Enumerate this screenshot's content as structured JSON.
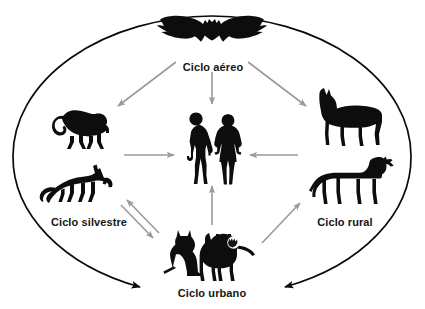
{
  "diagram": {
    "background_color": "#ffffff",
    "ellipse_color": "#000000",
    "arrow_color": "#9a9a9a",
    "silhouette_color": "#0d0d0d",
    "labels": [
      {
        "id": "aereo",
        "text": "Ciclo aéreo",
        "position": "top"
      },
      {
        "id": "silvestre",
        "text": "Ciclo silvestre",
        "position": "left"
      },
      {
        "id": "rural",
        "text": "Ciclo rural",
        "position": "right"
      },
      {
        "id": "urbano",
        "text": "Ciclo urbano",
        "position": "bottom"
      }
    ],
    "silhouettes": [
      {
        "id": "bat",
        "icon": "bat-icon",
        "group": "aereo"
      },
      {
        "id": "monkey",
        "icon": "monkey-icon",
        "group": "silvestre"
      },
      {
        "id": "fox",
        "icon": "fox-icon",
        "group": "silvestre"
      },
      {
        "id": "horse",
        "icon": "horse-icon",
        "group": "rural"
      },
      {
        "id": "cow",
        "icon": "cow-icon",
        "group": "rural"
      },
      {
        "id": "cat",
        "icon": "cat-icon",
        "group": "urbano"
      },
      {
        "id": "dog",
        "icon": "dog-icon",
        "group": "urbano"
      },
      {
        "id": "man",
        "icon": "man-icon",
        "group": "human"
      },
      {
        "id": "woman",
        "icon": "woman-icon",
        "group": "human"
      }
    ],
    "arrows": [
      {
        "id": "bat-to-monkey",
        "from": "bat",
        "to": "monkey",
        "style": "gray",
        "direction": "single"
      },
      {
        "id": "bat-to-human",
        "from": "bat",
        "to": "human",
        "style": "gray",
        "direction": "single"
      },
      {
        "id": "bat-to-horse",
        "from": "bat",
        "to": "horse",
        "style": "gray",
        "direction": "single"
      },
      {
        "id": "monkey-to-human",
        "from": "monkey",
        "to": "human",
        "style": "gray",
        "direction": "single"
      },
      {
        "id": "rural-to-human",
        "from": "cow",
        "to": "human",
        "style": "gray",
        "direction": "single"
      },
      {
        "id": "urbano-to-human",
        "from": "dog",
        "to": "human",
        "style": "gray",
        "direction": "single"
      },
      {
        "id": "silvestre-urbano",
        "from": "fox",
        "to": "cat",
        "style": "gray",
        "direction": "double"
      },
      {
        "id": "urbano-to-rural",
        "from": "dog",
        "to": "cow",
        "style": "gray",
        "direction": "single"
      },
      {
        "id": "ellipse-left-to-urbano",
        "from": "ellipse",
        "to": "urbano",
        "style": "black",
        "direction": "single"
      },
      {
        "id": "ellipse-right-to-urbano",
        "from": "ellipse",
        "to": "urbano",
        "style": "black",
        "direction": "single"
      }
    ]
  }
}
